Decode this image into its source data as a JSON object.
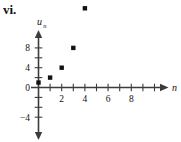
{
  "item_label": "vi.",
  "chart_data": {
    "type": "scatter",
    "title": "",
    "xlabel": "n",
    "ylabel": "u_n",
    "ylabel_base": "u",
    "ylabel_sub": "n",
    "x": [
      0,
      1,
      2,
      3,
      4
    ],
    "values": [
      0.5,
      1,
      2,
      4,
      8
    ],
    "points": [
      {
        "x": 0,
        "y": 0.5
      },
      {
        "x": 1,
        "y": 1
      },
      {
        "x": 2,
        "y": 2
      },
      {
        "x": 3,
        "y": 4
      },
      {
        "x": 4,
        "y": 8
      }
    ],
    "xlim": [
      -0.6,
      10.4
    ],
    "ylim": [
      -5.6,
      9.6
    ],
    "xticks": [
      1,
      2,
      3,
      4,
      5,
      6,
      7,
      8,
      9,
      10
    ],
    "xtick_labels": [
      {
        "value": 2,
        "label": "2"
      },
      {
        "value": 4,
        "label": "4"
      },
      {
        "value": 6,
        "label": "6"
      },
      {
        "value": 8,
        "label": "8"
      }
    ],
    "yticks": [
      -4,
      -2,
      2,
      4,
      6,
      8
    ],
    "ytick_labels": [
      {
        "value": 8,
        "label": "8"
      },
      {
        "value": 4,
        "label": "4"
      },
      {
        "value": 0,
        "label": "0"
      },
      {
        "value": -4,
        "label": "−4"
      }
    ],
    "grid": false,
    "legend": "none",
    "marker": "filled-square",
    "axis_color": "#3c3c3c",
    "marker_color": "#111111",
    "background": "#ffffff"
  }
}
